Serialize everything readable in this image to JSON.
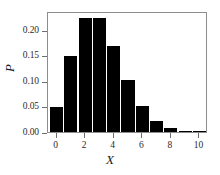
{
  "chart_data": {
    "type": "bar",
    "title": "",
    "subtitle": "",
    "xlabel": "X",
    "ylabel": "P",
    "categories": [
      0,
      1,
      2,
      3,
      4,
      5,
      6,
      7,
      8,
      9,
      10
    ],
    "values": [
      0.049,
      0.149,
      0.222,
      0.222,
      0.168,
      0.101,
      0.05,
      0.022,
      0.008,
      0.002,
      0.001
    ],
    "xlim": [
      -0.6,
      10.6
    ],
    "ylim": [
      0.0,
      0.2365
    ],
    "xticks": [
      0,
      2,
      4,
      6,
      8,
      10
    ],
    "xtick_labels": [
      "0",
      "2",
      "4",
      "6",
      "8",
      "10"
    ],
    "yticks": [
      0.0,
      0.05,
      0.1,
      0.15,
      0.2
    ],
    "ytick_labels": [
      "0.00",
      "0.05",
      "0.10",
      "0.15",
      "0.20"
    ],
    "grid": false,
    "legend": null,
    "bar_color": "#000000",
    "frame_color": "#8d8d8d",
    "tick_color": "#6e6e6e",
    "text_color": "#2b2b2b",
    "background_color": "#ffffff",
    "bar_width": 0.92,
    "annotations": []
  }
}
